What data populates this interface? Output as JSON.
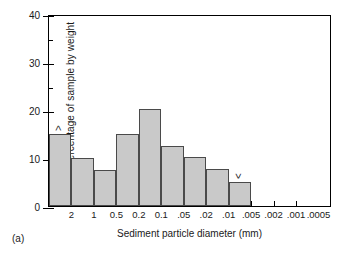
{
  "panel_label": "(a)",
  "chart_data": {
    "type": "bar",
    "title": "",
    "xlabel": "Sediment particle diameter (mm)",
    "ylabel": "Percentage of sample by weight",
    "ylim": [
      0,
      40
    ],
    "grid": false,
    "legend": "none",
    "y_ticks": [
      0,
      10,
      20,
      30,
      40
    ],
    "y_ticks_minor": [
      5,
      15,
      25,
      35
    ],
    "y_tick_labels": [
      "0",
      "10",
      "20",
      "30",
      "40"
    ],
    "x_tick_labels": [
      "2",
      "1",
      "0.5",
      "0.2",
      "0.1",
      ".05",
      ".02",
      ".01",
      ".005",
      ".002",
      ".001",
      ".0005"
    ],
    "categories": [
      ">2",
      "2-1",
      "1-0.5",
      "0.5-0.2",
      "0.2-0.1",
      "0.1-.05",
      ".05-.02",
      ".02-.01",
      ".01-.005"
    ],
    "values": [
      15,
      10,
      7.5,
      15,
      20.2,
      12.5,
      10.3,
      7.8,
      5
    ],
    "annotations": [
      {
        "text": ">",
        "bar_index": 0
      },
      {
        "text": "<",
        "bar_index": 8
      }
    ],
    "colors": {
      "bar_fill": "#c9c9c9",
      "bar_edge": "#4a4a4a",
      "axis": "#000000",
      "text": "#1a1a1a"
    }
  }
}
